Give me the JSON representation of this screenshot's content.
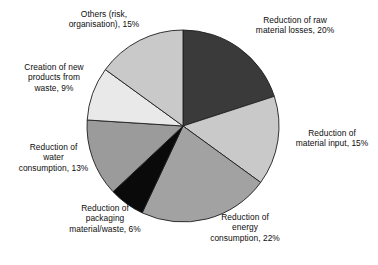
{
  "figure": {
    "background_color": "#ffffff",
    "clipped_title_remnant": "     "
  },
  "chart_data": {
    "type": "pie",
    "title": "",
    "subtitle": "",
    "xlabel": "",
    "ylabel": "",
    "legend_position": "none",
    "grid": false,
    "units": "%",
    "start_angle_deg": 0,
    "direction": "clockwise",
    "center_px": [
      183,
      126
    ],
    "radius_px": 96,
    "categories": [
      "Reduction of raw material losses",
      "Reduction of material input",
      "Reduction of energy consumption",
      "Reduction of packaging material/waste",
      "Reduction of water consumption",
      "Creation of new products from waste",
      "Others (risk, organisation)"
    ],
    "values": [
      20,
      15,
      22,
      6,
      13,
      9,
      15
    ],
    "colors": [
      "#3a3a3a",
      "#c9c9c9",
      "#a2a2a2",
      "#0a0a0a",
      "#9b9b9b",
      "#e9e9e9",
      "#c9c9c9"
    ],
    "slice_outline_color": "#1d1d1d",
    "slices": [
      {
        "name": "Reduction of raw material losses",
        "value": 20,
        "value_label": "20%",
        "color": "#3a3a3a",
        "label_text": "Reduction of raw\nmaterial losses, 20%"
      },
      {
        "name": "Reduction of material input",
        "value": 15,
        "value_label": "15%",
        "color": "#c9c9c9",
        "label_text": "Reduction of\nmaterial input, 15%"
      },
      {
        "name": "Reduction of energy consumption",
        "value": 22,
        "value_label": "22%",
        "color": "#a2a2a2",
        "label_text": "Reduction of\nenergy\nconsumption, 22%"
      },
      {
        "name": "Reduction of packaging material/waste",
        "value": 6,
        "value_label": "6%",
        "color": "#0a0a0a",
        "label_text": "Reduction of\npackaging\nmaterial/waste, 6%"
      },
      {
        "name": "Reduction of water consumption",
        "value": 13,
        "value_label": "13%",
        "color": "#9b9b9b",
        "label_text": "Reduction of\nwater\nconsumption, 13%"
      },
      {
        "name": "Creation of new products from waste",
        "value": 9,
        "value_label": "9%",
        "color": "#e9e9e9",
        "label_text": "Creation of new\nproducts from\nwaste, 9%"
      },
      {
        "name": "Others (risk, organisation)",
        "value": 15,
        "value_label": "15%",
        "color": "#c9c9c9",
        "label_text": "Others (risk,\norganisation), 15%"
      }
    ]
  }
}
